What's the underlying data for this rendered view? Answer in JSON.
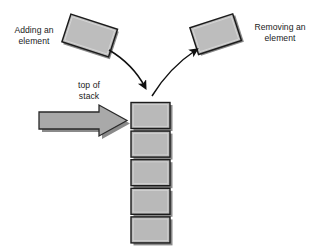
{
  "diagram": {
    "labels": {
      "adding": "Adding an\nelement",
      "removing": "Removing an\nelement",
      "top_of_stack": "top of\nstack"
    },
    "colors": {
      "background": "#ffffff",
      "box_fill": "#b9b9b9",
      "box_fill_light": "#c4c4c4",
      "box_border": "#1c1c1c",
      "shadow": "#8a8a8a",
      "arrow_stroke": "#111111",
      "block_arrow_fill": "#a9a9a9",
      "text": "#1a1a1a"
    },
    "stack": {
      "element_count": 5,
      "elements": [
        {
          "index": 0,
          "role": "top-element"
        },
        {
          "index": 1,
          "role": "stack-element"
        },
        {
          "index": 2,
          "role": "stack-element"
        },
        {
          "index": 3,
          "role": "stack-element"
        },
        {
          "index": 4,
          "role": "bottom-element"
        }
      ]
    },
    "floating_elements": [
      {
        "name": "incoming-element",
        "rotation_deg": 18,
        "side": "left"
      },
      {
        "name": "outgoing-element",
        "rotation_deg": -18,
        "side": "right"
      }
    ],
    "arrows": [
      {
        "name": "push-arrow",
        "direction": "into-stack",
        "style": "curved"
      },
      {
        "name": "pop-arrow",
        "direction": "out-of-stack",
        "style": "curved"
      },
      {
        "name": "top-of-stack-pointer",
        "direction": "right",
        "style": "block"
      }
    ]
  }
}
